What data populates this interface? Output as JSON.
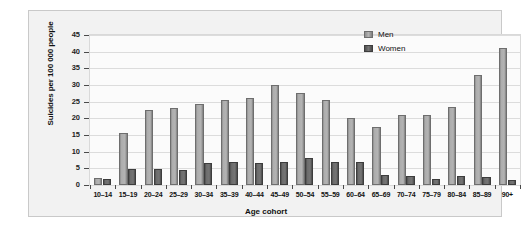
{
  "chart_data": {
    "type": "bar",
    "title": "",
    "subtitle": "",
    "xlabel": "Age cohort",
    "ylabel": "Suicides per 100 000 people",
    "ylim": [
      0,
      45
    ],
    "ytick_step": 5,
    "yticks": [
      "45",
      "40",
      "35",
      "30",
      "25",
      "20",
      "15",
      "10",
      "5",
      "0"
    ],
    "grid": true,
    "legend_position": "top-right-inside",
    "categories": [
      "10–14",
      "15–19",
      "20–24",
      "25–29",
      "30–34",
      "35–39",
      "40–44",
      "45–49",
      "50–54",
      "55–59",
      "60–64",
      "65–69",
      "70–74",
      "75–79",
      "80–84",
      "85–89",
      "90+"
    ],
    "series": [
      {
        "name": "Men",
        "color": "#b0b0b0",
        "values": [
          2.0,
          15.5,
          22.5,
          23.2,
          24.2,
          25.5,
          26.2,
          30.0,
          27.5,
          25.5,
          20.0,
          17.5,
          21.0,
          21.0,
          23.3,
          33.0,
          41.0
        ]
      },
      {
        "name": "Women",
        "color": "#6a6a6a",
        "values": [
          1.8,
          4.8,
          4.8,
          4.6,
          6.5,
          6.8,
          6.5,
          6.8,
          8.0,
          7.0,
          6.8,
          3.0,
          2.8,
          1.7,
          2.8,
          2.5,
          1.6
        ]
      }
    ]
  },
  "legend": {
    "items": [
      {
        "label": "Men",
        "swatch": "men-swatch"
      },
      {
        "label": "Women",
        "swatch": "women-swatch"
      }
    ]
  }
}
